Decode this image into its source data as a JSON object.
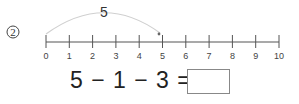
{
  "problem": {
    "number": "2",
    "number_line": {
      "min": 0,
      "max": 10,
      "ticks": [
        "0",
        "1",
        "2",
        "3",
        "4",
        "5",
        "6",
        "7",
        "8",
        "9",
        "10"
      ]
    },
    "jump": {
      "from": 0,
      "to": 5,
      "label": "5"
    },
    "equation": {
      "text": "5 − 1 − 3 =",
      "answer": ""
    },
    "colors": {
      "line": "#555555",
      "arc": "#cccccc",
      "box_border": "#888888"
    }
  }
}
